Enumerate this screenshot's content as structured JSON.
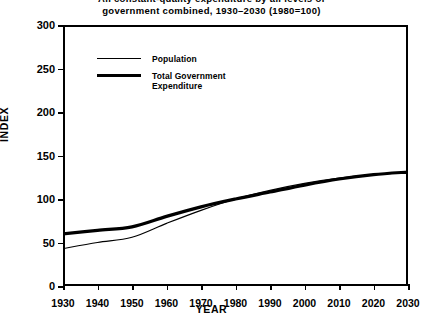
{
  "chart_data": {
    "type": "line",
    "title_lines": [
      "All constant-quality expenditure by all levels of",
      "government combined, 1930–2030 (1980=100)"
    ],
    "xlabel": "YEAR",
    "ylabel": "INDEX",
    "xlim": [
      1930,
      2030
    ],
    "ylim": [
      0,
      300
    ],
    "grid": false,
    "legend_position": "upper-left-inside",
    "x_ticks": [
      1930,
      1940,
      1950,
      1960,
      1970,
      1980,
      1990,
      2000,
      2010,
      2020,
      2030
    ],
    "x_tick_labels": [
      "1930",
      "1940",
      "1950",
      "1960",
      "1970",
      "1980",
      "1990",
      "2000",
      "2010",
      "2020",
      "2030"
    ],
    "y_ticks": [
      0,
      50,
      100,
      150,
      200,
      250,
      300
    ],
    "y_tick_labels": [
      "0",
      "50",
      "100",
      "150",
      "200",
      "250",
      "300"
    ],
    "x": [
      1930,
      1940,
      1950,
      1960,
      1970,
      1980,
      1990,
      2000,
      2010,
      2020,
      2030
    ],
    "series": [
      {
        "name": "Population",
        "legend_label": "Population",
        "line_style": "thin",
        "line_width": 1.2,
        "color": "#000000",
        "values": [
          43,
          50,
          56,
          72,
          87,
          100,
          110,
          118,
          124,
          128,
          131
        ]
      },
      {
        "name": "Total Government Expenditure",
        "legend_label": "Total Government\nExpenditure",
        "line_style": "thick",
        "line_width": 3.2,
        "color": "#000000",
        "values": [
          60,
          64,
          68,
          80,
          91,
          100,
          108,
          116,
          123,
          128,
          131
        ]
      }
    ],
    "annotations": []
  },
  "legend": {
    "items": [
      {
        "label": "Population",
        "style": "thin"
      },
      {
        "label": "Total Government\nExpenditure",
        "style": "thick"
      }
    ]
  },
  "colors": {
    "ink": "#000000",
    "background": "#ffffff"
  }
}
